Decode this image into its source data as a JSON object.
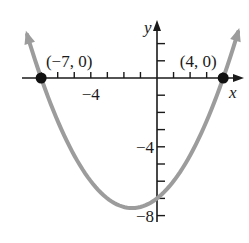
{
  "chart_data": {
    "type": "line",
    "title": "",
    "xlabel": "x",
    "ylabel": "y",
    "function": "y = 0.25(x + 7)(x - 4)",
    "xlim": [
      -8,
      4.9
    ],
    "ylim": [
      -8.3,
      3.3
    ],
    "x_ticks": [
      -7,
      -6,
      -5,
      -4,
      -3,
      -2,
      -1,
      1,
      2,
      3,
      4
    ],
    "x_tick_labels": [
      {
        "value": -4,
        "label": "−4"
      }
    ],
    "y_ticks": [
      2,
      1,
      -1,
      -2,
      -3,
      -4,
      -5,
      -6,
      -7,
      -8
    ],
    "y_tick_labels": [
      {
        "value": -4,
        "label": "−4"
      },
      {
        "value": -8,
        "label": "−8"
      }
    ],
    "grid": false,
    "series": [
      {
        "name": "parabola",
        "color": "#9c9c9c",
        "x": [
          -7.85,
          -7,
          -6,
          -5,
          -4,
          -3,
          -2,
          -1.5,
          -1,
          0,
          1,
          2,
          3,
          4,
          4.9
        ],
        "y": [
          2.52,
          0,
          -2.5,
          -4.5,
          -6,
          -7,
          -7.5,
          -7.5625,
          -7.5,
          -7,
          -6,
          -4.5,
          -2.5,
          0,
          2.7
        ]
      }
    ],
    "points": [
      {
        "x": -7,
        "y": 0,
        "label": "(−7, 0)"
      },
      {
        "x": 4,
        "y": 0,
        "label": "(4, 0)"
      }
    ],
    "colors": {
      "axis": "#1a1a1a",
      "curve": "#9c9c9c",
      "point": "#111111"
    }
  }
}
